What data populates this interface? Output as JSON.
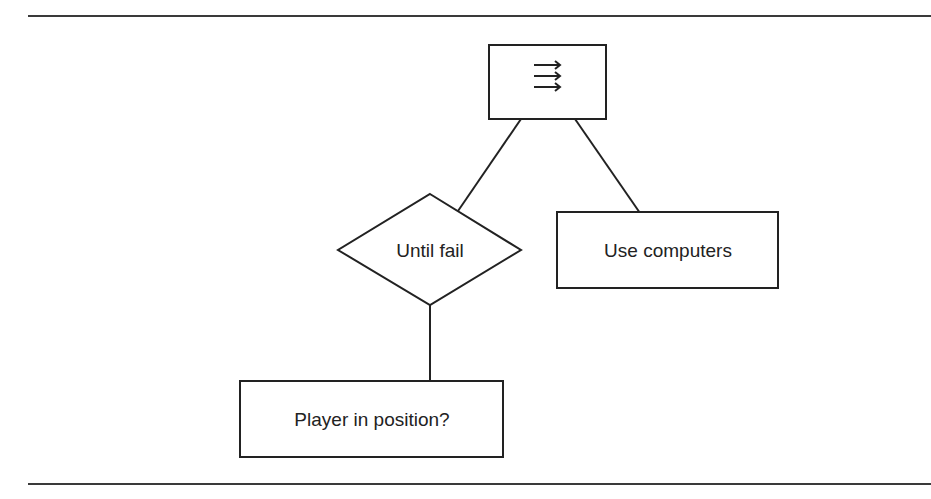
{
  "diagram": {
    "type": "behavior-tree",
    "line_color": "#222222",
    "nodes": [
      {
        "id": "sequence",
        "shape": "rectangle",
        "label": "",
        "icon": "sequence-arrows-icon",
        "icon_glyph": "⟶⟶⟶"
      },
      {
        "id": "until-fail",
        "shape": "diamond",
        "label": "Until fail"
      },
      {
        "id": "use-computers",
        "shape": "rectangle",
        "label": "Use computers"
      },
      {
        "id": "player-in-position",
        "shape": "rectangle",
        "label": "Player in position?"
      }
    ],
    "edges": [
      {
        "from": "sequence",
        "to": "until-fail"
      },
      {
        "from": "sequence",
        "to": "use-computers"
      },
      {
        "from": "until-fail",
        "to": "player-in-position"
      }
    ]
  },
  "labels": {
    "until_fail": "Until fail",
    "use_computers": "Use computers",
    "player_in_position": "Player in position?"
  }
}
